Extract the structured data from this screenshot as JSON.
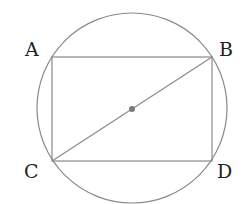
{
  "diagram": {
    "colors": {
      "stroke": "#8a8a8a",
      "center_dot": "#7a7a7a",
      "label": "#222222",
      "background": "#ffffff"
    },
    "circle": {
      "cx": 132,
      "cy": 108,
      "r": 95
    },
    "center": {
      "x": 132,
      "y": 109,
      "r": 3
    },
    "points": {
      "A": {
        "label": "A",
        "x": 52,
        "y": 57
      },
      "B": {
        "label": "B",
        "x": 212,
        "y": 57
      },
      "C": {
        "label": "C",
        "x": 52,
        "y": 161
      },
      "D": {
        "label": "D",
        "x": 212,
        "y": 161
      }
    },
    "segments": [
      [
        "A",
        "B"
      ],
      [
        "B",
        "D"
      ],
      [
        "D",
        "C"
      ],
      [
        "C",
        "A"
      ],
      [
        "C",
        "B"
      ]
    ]
  }
}
